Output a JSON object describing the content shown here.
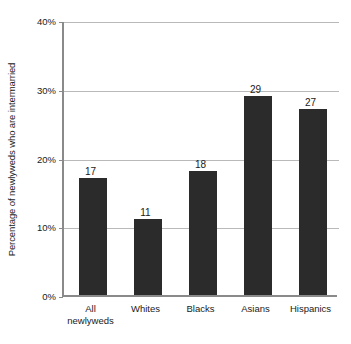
{
  "chart_data": {
    "type": "bar",
    "title": "",
    "subtitle": "",
    "xlabel": "",
    "ylabel": "Percentage of newlyweds who are intermarried",
    "categories": [
      "All newlyweds",
      "Whites",
      "Blacks",
      "Asians",
      "Hispanics"
    ],
    "values": [
      17,
      11,
      18,
      29,
      27
    ],
    "value_labels": [
      "17",
      "11",
      "18",
      "29",
      "27"
    ],
    "ylim": [
      0,
      40
    ],
    "ytick_values": [
      0,
      10,
      20,
      30,
      40
    ],
    "ytick_labels": [
      "0%",
      "10%",
      "20%",
      "30%",
      "40%"
    ],
    "grid": true,
    "legend": "none",
    "bar_color": "#2b2b2b",
    "gridline_color": "#b9b9b9",
    "axis_color": "#8a8a8a",
    "background_color": "#ffffff"
  },
  "axis": {
    "y_title": "Percentage of newlyweds who are intermarried"
  },
  "category_labels": [
    "All\nnewlyweds",
    "Whites",
    "Blacks",
    "Asians",
    "Hispanics"
  ]
}
